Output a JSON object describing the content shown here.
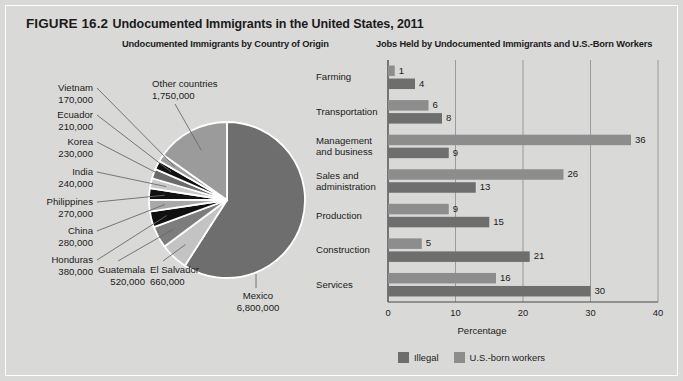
{
  "figure": {
    "number": "FIGURE 16.2",
    "title": "Undocumented Immigrants in the United States, 2011"
  },
  "panels": {
    "pie_subtitle": "Undocumented Immigrants by Country of Origin",
    "bar_subtitle": "Jobs Held by Undocumented Immigrants and U.S.-Born Workers"
  },
  "legend": {
    "items": [
      {
        "label": "Illegal",
        "color": "#6e6e6e"
      },
      {
        "label": "U.S.-born workers",
        "color": "#8d8d8d"
      }
    ]
  },
  "colors": {
    "panel_background": "#d9d9d7",
    "mexico_slice": "#6e6e6e",
    "other_slice": "#9b9b9b",
    "text": "#1b1b1b",
    "gridline": "#8b8b8b",
    "axis": "#4a4a4a"
  },
  "chart_data": [
    {
      "type": "pie",
      "title": "Undocumented Immigrants by Country of Origin",
      "unit": "persons",
      "labels": [
        "Mexico",
        "Other countries",
        "El Salvador",
        "Guatemala",
        "Honduras",
        "China",
        "Philippines",
        "India",
        "Korea",
        "Ecuador",
        "Vietnam"
      ],
      "values": [
        6800000,
        1750000,
        660000,
        520000,
        380000,
        280000,
        270000,
        240000,
        230000,
        210000,
        170000
      ],
      "value_labels": [
        "6,800,000",
        "1,750,000",
        "660,000",
        "520,000",
        "380,000",
        "280,000",
        "270,000",
        "240,000",
        "230,000",
        "210,000",
        "170,000"
      ],
      "slice_colors": [
        "#6e6e6e",
        "#9b9b9b",
        "#c3c3c3",
        "#7d7d7d",
        "#101010",
        "#a8a8a8",
        "#111111",
        "#c9c9c9",
        "#6b6b6b",
        "#111111",
        "#9f9f9f"
      ]
    },
    {
      "type": "bar",
      "orientation": "horizontal",
      "title": "Jobs Held by Undocumented Immigrants and U.S.-Born Workers",
      "categories": [
        "Farming",
        "Transportation",
        "Management and business",
        "Sales and administration",
        "Production",
        "Construction",
        "Services"
      ],
      "series": [
        {
          "name": "U.S.-born workers",
          "color": "#8d8d8d",
          "values": [
            1,
            6,
            36,
            26,
            9,
            5,
            16
          ]
        },
        {
          "name": "Illegal",
          "color": "#6e6e6e",
          "values": [
            4,
            8,
            9,
            13,
            15,
            21,
            30
          ]
        }
      ],
      "xlabel": "Percentage",
      "ylabel": "",
      "xlim": [
        0,
        40
      ],
      "xticks": [
        0,
        10,
        20,
        30,
        40
      ],
      "xtick_labels": [
        "0",
        "10",
        "20",
        "30",
        "40"
      ],
      "grid": true,
      "legend_position": "bottom"
    }
  ],
  "pie_labels": [
    {
      "name": "Vietnam",
      "value": "170,000"
    },
    {
      "name": "Ecuador",
      "value": "210,000"
    },
    {
      "name": "Korea",
      "value": "230,000"
    },
    {
      "name": "India",
      "value": "240,000"
    },
    {
      "name": "Philippines",
      "value": "270,000"
    },
    {
      "name": "China",
      "value": "280,000"
    },
    {
      "name": "Honduras",
      "value": "380,000"
    },
    {
      "name": "Guatemala",
      "value": "520,000"
    },
    {
      "name": "El Salvador",
      "value": "660,000"
    },
    {
      "name": "Mexico",
      "value": "6,800,000"
    },
    {
      "name": "Other countries",
      "value": "1,750,000"
    }
  ],
  "bar_categories": [
    {
      "line1": "Farming",
      "line2": ""
    },
    {
      "line1": "Transportation",
      "line2": ""
    },
    {
      "line1": "Management",
      "line2": "and business"
    },
    {
      "line1": "Sales and",
      "line2": "administration"
    },
    {
      "line1": "Production",
      "line2": ""
    },
    {
      "line1": "Construction",
      "line2": ""
    },
    {
      "line1": "Services",
      "line2": ""
    }
  ],
  "bar_values": {
    "farming_us": "1",
    "farming_illegal": "4",
    "transportation_us": "6",
    "transportation_illegal": "8",
    "management_us": "36",
    "management_illegal": "9",
    "sales_us": "26",
    "sales_illegal": "13",
    "production_us": "9",
    "production_illegal": "15",
    "construction_us": "5",
    "construction_illegal": "21",
    "services_us": "16",
    "services_illegal": "30"
  },
  "axis": {
    "xlabel": "Percentage",
    "ticks": [
      "0",
      "10",
      "20",
      "30",
      "40"
    ]
  }
}
